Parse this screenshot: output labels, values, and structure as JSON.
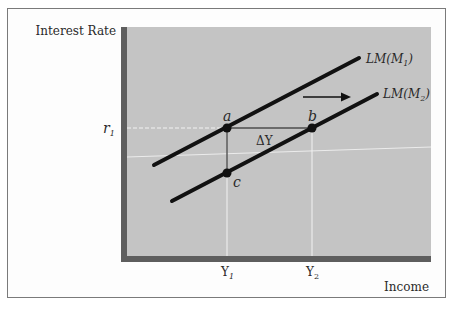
{
  "diagram": {
    "type": "economics-lm-shift",
    "y_axis_label": "Interest Rate",
    "x_axis_label": "Income",
    "y_ticks": [
      {
        "label": "r",
        "sub": "1"
      }
    ],
    "x_ticks": [
      {
        "label": "Y",
        "sub": "1"
      },
      {
        "label": "Y",
        "sub": "2"
      }
    ],
    "curves": [
      {
        "name": "LM(M1)",
        "label_main": "LM(M",
        "label_sub": "1",
        "label_close": ")"
      },
      {
        "name": "LM(M2)",
        "label_main": "LM(M",
        "label_sub": "2",
        "label_close": ")"
      }
    ],
    "points": [
      {
        "name": "a",
        "label": "a"
      },
      {
        "name": "b",
        "label": "b"
      },
      {
        "name": "c",
        "label": "c"
      }
    ],
    "delta_label": "ΔY",
    "shift_arrow": "right-arrow",
    "colors": {
      "plot_background": "#c4c4c4",
      "axis_bar": "#5e5e5e",
      "curve": "#111111",
      "gridline": "#f2f2f2",
      "frame_border": "#7a7a7a"
    }
  }
}
